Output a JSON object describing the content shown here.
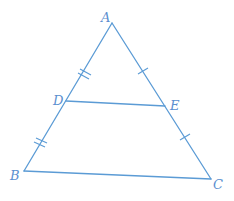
{
  "diagram": {
    "type": "triangle-midsegment",
    "color": "#5b9bd5",
    "label_color": "#5b8fcf",
    "points": {
      "A": {
        "label": "A",
        "x": 112,
        "y": 23,
        "label_x": 101,
        "label_y": 11
      },
      "B": {
        "label": "B",
        "x": 24,
        "y": 171,
        "label_x": 10,
        "label_y": 169
      },
      "C": {
        "label": "C",
        "x": 211,
        "y": 179,
        "label_x": 213,
        "label_y": 178
      },
      "D": {
        "label": "D",
        "x": 66,
        "y": 101,
        "label_x": 53,
        "label_y": 94
      },
      "E": {
        "label": "E",
        "x": 165,
        "y": 106,
        "label_x": 170,
        "label_y": 99
      }
    },
    "segments": [
      {
        "from": "A",
        "to": "B"
      },
      {
        "from": "A",
        "to": "C"
      },
      {
        "from": "B",
        "to": "C"
      },
      {
        "from": "D",
        "to": "E"
      }
    ],
    "tick_marks": [
      {
        "segment": "AD",
        "count": 2
      },
      {
        "segment": "DB",
        "count": 2
      },
      {
        "segment": "AE",
        "count": 1
      },
      {
        "segment": "EC",
        "count": 1
      }
    ]
  }
}
